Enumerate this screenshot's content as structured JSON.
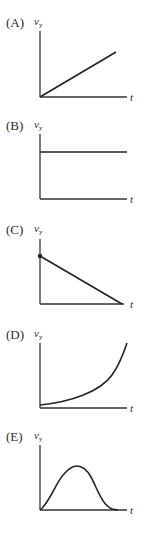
{
  "options": [
    {
      "label": "(A)",
      "y_axis": "v",
      "y_sub": "y",
      "x_axis": "t",
      "shape": "linear increasing from origin"
    },
    {
      "label": "(B)",
      "y_axis": "v",
      "y_sub": "y",
      "x_axis": "t",
      "shape": "constant horizontal"
    },
    {
      "label": "(C)",
      "y_axis": "v",
      "y_sub": "y",
      "x_axis": "t",
      "shape": "linear decreasing to zero, starting dot on y-axis"
    },
    {
      "label": "(D)",
      "y_axis": "v",
      "y_sub": "y",
      "x_axis": "t",
      "shape": "exponential increasing"
    },
    {
      "label": "(E)",
      "y_axis": "v",
      "y_sub": "y",
      "x_axis": "t",
      "shape": "bell-shaped pulse"
    }
  ]
}
